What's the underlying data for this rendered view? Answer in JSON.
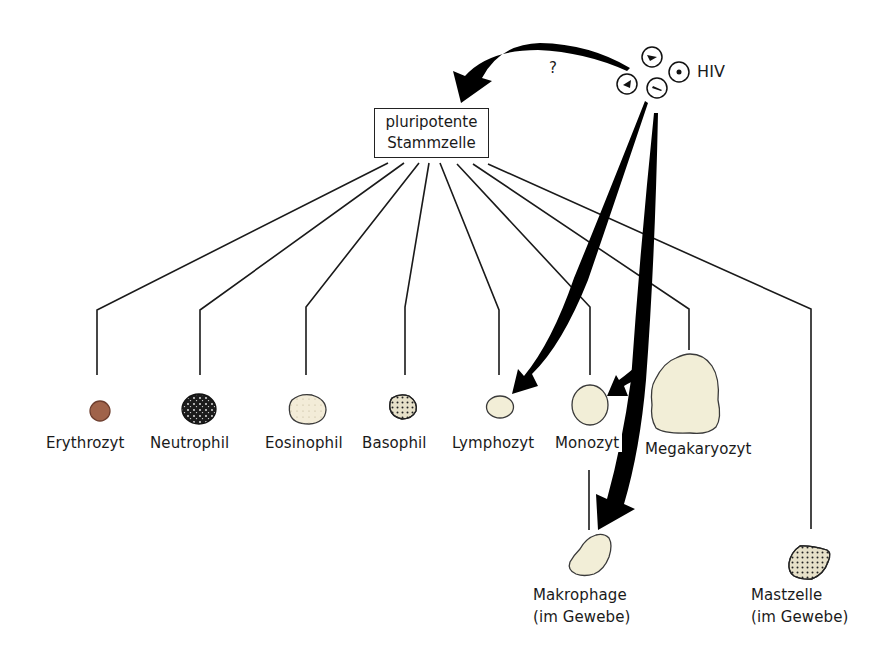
{
  "diagram": {
    "type": "cell-lineage-diagram",
    "language": "de",
    "root": {
      "label_line1": "pluripotente",
      "label_line2": "Stammzelle"
    },
    "virus": {
      "label": "HIV",
      "particle_count": 4,
      "arrows": [
        {
          "to": "pluripotente Stammzelle",
          "annotation": "?"
        },
        {
          "to": "Lymphozyt"
        },
        {
          "to": "Monozyt"
        },
        {
          "to": "Makrophage"
        }
      ],
      "question_mark": "?"
    },
    "cells": [
      {
        "id": "erythrozyt",
        "label": "Erythrozyt",
        "color": "#a0634a"
      },
      {
        "id": "neutrophil",
        "label": "Neutrophil",
        "color": "#1c1c1c"
      },
      {
        "id": "eosinophil",
        "label": "Eosinophil",
        "color": "#f3ecd8"
      },
      {
        "id": "basophil",
        "label": "Basophil",
        "color": "#e7e1c9"
      },
      {
        "id": "lymphozyt",
        "label": "Lymphozyt",
        "color": "#f2eed7"
      },
      {
        "id": "monozyt",
        "label": "Monozyt",
        "color": "#f2eed7"
      },
      {
        "id": "megakaryozyt",
        "label": "Megakaryozyt",
        "color": "#f2eed7"
      },
      {
        "id": "makrophage",
        "label": "Makrophage",
        "sublabel": "(im Gewebe)",
        "color": "#f2eed7",
        "derived_from": "Monozyt"
      },
      {
        "id": "mastzelle",
        "label": "Mastzelle",
        "sublabel": "(im Gewebe)",
        "color": "#e7e1c9"
      }
    ]
  },
  "colors": {
    "line": "#1a1a1a",
    "arrow": "#000000",
    "background": "#ffffff"
  }
}
